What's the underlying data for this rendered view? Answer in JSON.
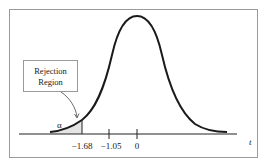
{
  "diagram": {
    "type": "t-distribution rejection region (left-tailed test)",
    "box_label_line1": "Rejection",
    "box_label_line2": "Region",
    "alpha_label": "α",
    "axis_label": "t",
    "ticks": [
      {
        "label": "−1.68",
        "value": -1.68
      },
      {
        "label": "−1.05",
        "value": -1.05
      },
      {
        "label": "0",
        "value": 0
      }
    ],
    "critical_value": -1.68,
    "test_statistic": -1.05,
    "colors": {
      "curve": "#1a1a1a",
      "shade": "#e4e4e4",
      "border": "#9a9a9a"
    }
  }
}
